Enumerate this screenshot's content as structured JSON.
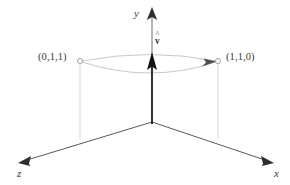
{
  "figure": {
    "background_color": "#ffffff",
    "axis_color": "#4a4a4a",
    "curve_color": "#b8b8b8",
    "drop_line_color": "#cccccc",
    "vector_color": "#1a1a1a",
    "label_color": "#3a3a3a"
  },
  "axes": {
    "y": {
      "label": "y",
      "arrow": "up-arrowhead"
    },
    "x": {
      "label": "x",
      "arrow": "down-right-arrowhead"
    },
    "z": {
      "label": "z",
      "arrow": "down-left-arrowhead"
    }
  },
  "points": [
    {
      "id": "left",
      "label": "(0,1,1)",
      "marker": "open-circle"
    },
    {
      "id": "right",
      "label": "(1,1,0)",
      "marker": "open-circle"
    }
  ],
  "vector": {
    "hat": "^",
    "symbol": "v",
    "label": "v̂",
    "direction": "up along y-axis"
  },
  "curve": {
    "description": "lens-shaped pair of arcs connecting the two points",
    "arrow": "arrowhead near right endpoint"
  }
}
